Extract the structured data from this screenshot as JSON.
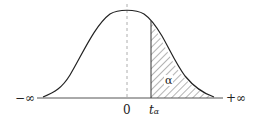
{
  "diagram": {
    "type": "normal-distribution-upper-tail",
    "labels": {
      "neg_inf": "−∞",
      "pos_inf": "+∞",
      "zero": "0",
      "t": "t",
      "t_sub": "α",
      "area": "α"
    },
    "colors": {
      "curve": "#222222",
      "axis": "#555555",
      "hatch": "#444444",
      "dashed": "#999999"
    }
  }
}
